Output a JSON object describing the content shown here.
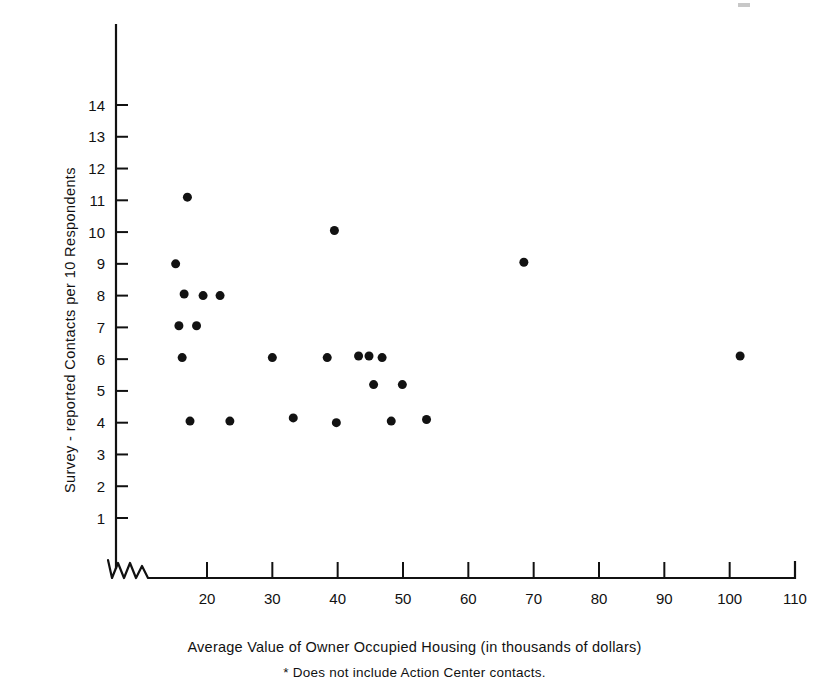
{
  "figure": {
    "x_axis_title": "Average Value of Owner Occupied Housing  (in thousands of dollars)",
    "y_axis_title": "Survey - reported Contacts per 10  Respondents",
    "footnote": "* Does not include Action Center contacts."
  },
  "chart_data": {
    "type": "scatter",
    "title": "",
    "xlabel": "Average Value of Owner Occupied Housing  (in thousands of dollars)",
    "ylabel": "Survey - reported Contacts per 10  Respondents",
    "footnote": "* Does not include Action Center contacts.",
    "grid": false,
    "legend": false,
    "axis_break_x": true,
    "axis_break_note": "x-axis has a zigzag break between 0 and the first labeled tick",
    "xlim": [
      13,
      110
    ],
    "ylim": [
      0,
      15
    ],
    "xticks": [
      20,
      30,
      40,
      50,
      60,
      70,
      80,
      90,
      100,
      110
    ],
    "xticklabels": [
      "20",
      "30",
      "40",
      "50",
      "60",
      "70",
      "80",
      "90",
      "100",
      "110"
    ],
    "yticks": [
      1,
      2,
      3,
      4,
      5,
      6,
      7,
      8,
      9,
      10,
      11,
      12,
      13,
      14
    ],
    "yticklabels": [
      "1",
      "2",
      "3",
      "4",
      "5",
      "6",
      "7",
      "8",
      "9",
      "10",
      "11",
      "12",
      "13",
      "14"
    ],
    "marker": "filled-circle",
    "marker_color": "#121212",
    "marker_size_px": 9,
    "points": [
      {
        "x": 17.0,
        "y": 11.1
      },
      {
        "x": 15.2,
        "y": 9.0
      },
      {
        "x": 16.5,
        "y": 8.05
      },
      {
        "x": 19.4,
        "y": 8.0
      },
      {
        "x": 22.0,
        "y": 8.0
      },
      {
        "x": 15.7,
        "y": 7.05
      },
      {
        "x": 18.4,
        "y": 7.05
      },
      {
        "x": 16.2,
        "y": 6.05
      },
      {
        "x": 30.0,
        "y": 6.05
      },
      {
        "x": 38.4,
        "y": 6.05
      },
      {
        "x": 43.2,
        "y": 6.1
      },
      {
        "x": 44.8,
        "y": 6.1
      },
      {
        "x": 46.8,
        "y": 6.05
      },
      {
        "x": 101.6,
        "y": 6.1
      },
      {
        "x": 45.5,
        "y": 5.2
      },
      {
        "x": 49.9,
        "y": 5.2
      },
      {
        "x": 17.4,
        "y": 4.05
      },
      {
        "x": 23.5,
        "y": 4.05
      },
      {
        "x": 33.2,
        "y": 4.15
      },
      {
        "x": 39.8,
        "y": 4.0
      },
      {
        "x": 48.2,
        "y": 4.05
      },
      {
        "x": 53.6,
        "y": 4.1
      },
      {
        "x": 39.5,
        "y": 10.05
      },
      {
        "x": 68.5,
        "y": 9.05
      }
    ]
  }
}
